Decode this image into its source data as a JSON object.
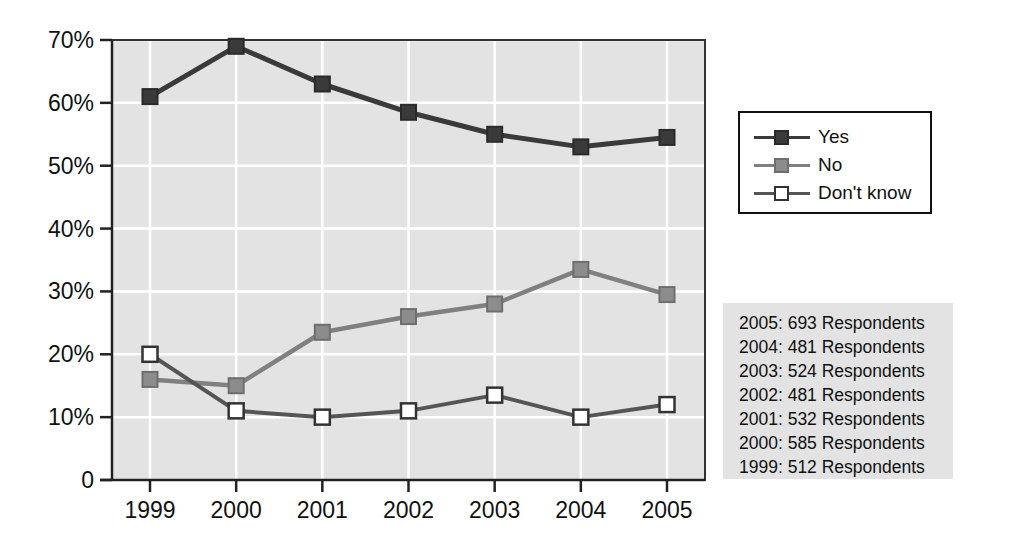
{
  "chart_data": {
    "type": "line",
    "title": "",
    "subtitle": "",
    "xlabel": "",
    "ylabel": "",
    "x": [
      "1999",
      "2000",
      "2001",
      "2002",
      "2003",
      "2004",
      "2005"
    ],
    "categories": [
      "1999",
      "2000",
      "2001",
      "2002",
      "2003",
      "2004",
      "2005"
    ],
    "series": [
      {
        "name": "Yes",
        "color": "#3a3a3a",
        "marker": "filled-square",
        "values": [
          61.0,
          69.0,
          63.0,
          58.5,
          55.0,
          53.0,
          54.5
        ]
      },
      {
        "name": "No",
        "color": "#808080",
        "marker": "gray-square",
        "values": [
          16.0,
          15.0,
          23.5,
          26.0,
          28.0,
          33.5,
          29.5
        ]
      },
      {
        "name": "Don't know",
        "color": "#555555",
        "marker": "open-square",
        "values": [
          20.0,
          11.0,
          10.0,
          11.0,
          13.5,
          10.0,
          12.0
        ]
      }
    ],
    "ylim": [
      0,
      70
    ],
    "yticks": [
      0,
      10,
      20,
      30,
      40,
      50,
      60,
      70
    ],
    "ytick_labels": [
      "0",
      "10%",
      "20%",
      "30%",
      "40%",
      "50%",
      "60%",
      "70%"
    ],
    "xtick_labels": [
      "1999",
      "2000",
      "2001",
      "2002",
      "2003",
      "2004",
      "2005"
    ],
    "grid": true,
    "grid_color": "#ffffff",
    "plot_background": "#e3e3e3",
    "legend_position": "right-top"
  },
  "legend": {
    "items": [
      {
        "label": "Yes",
        "color": "#3a3a3a",
        "marker": "filled-square"
      },
      {
        "label": "No",
        "color": "#808080",
        "marker": "gray-square"
      },
      {
        "label": "Don't know",
        "color": "#ffffff",
        "marker": "open-square"
      }
    ]
  },
  "respondents": {
    "lines": [
      "2005: 693 Respondents",
      "2004: 481 Respondents",
      "2003: 524 Respondents",
      "2002: 481 Respondents",
      "2001: 532 Respondents",
      "2000: 585 Respondents",
      "1999: 512 Respondents"
    ]
  }
}
